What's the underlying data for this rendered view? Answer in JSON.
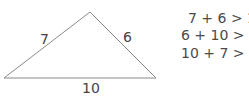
{
  "triangle": {
    "sides": {
      "left": "7",
      "right": "6",
      "bottom": "10"
    },
    "vertices": {
      "left": [
        4,
        78
      ],
      "apex": [
        90,
        12
      ],
      "right": [
        156,
        78
      ]
    },
    "stroke_color": "#8a8a8a"
  },
  "inequalities": [
    "7 + 6 > 10",
    "6 + 10 > 7",
    "10 + 7 > 6"
  ]
}
